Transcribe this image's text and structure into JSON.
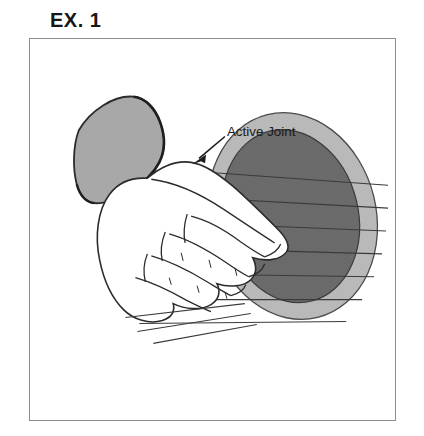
{
  "figure": {
    "title": "EX. 1",
    "caption_label": "Active Joint",
    "colors": {
      "ink": "#2b2b2b",
      "frame": "#8d8d8d",
      "background": "#ffffff",
      "skin": "#ffffff",
      "sleeve_fill": "#a6a6a6",
      "ball_outer_ring": "#b9b9b9",
      "ball_inner": "#6e6e6e",
      "string": "#3a3a3a",
      "title_text": "#161616",
      "label_text": "#1b1b1b"
    },
    "annotations": [
      {
        "name": "active-joint-callout",
        "text": "Active Joint",
        "text_x": 199,
        "text_y": 93,
        "arrow_from_x": 198,
        "arrow_from_y": 96,
        "arrow_to_x": 166,
        "arrow_to_y": 123
      }
    ],
    "scene": {
      "description": "Line drawing of a hand in a sleeve gripping a hatched oval ball with strings",
      "ball": {
        "center_x": 264,
        "center_y": 178,
        "radius_x": 84,
        "radius_y": 105,
        "rotation_deg": -14,
        "inner_inset": 16,
        "string_count": 8
      },
      "string_extent_left": 108,
      "string_extent_right": 360
    }
  }
}
